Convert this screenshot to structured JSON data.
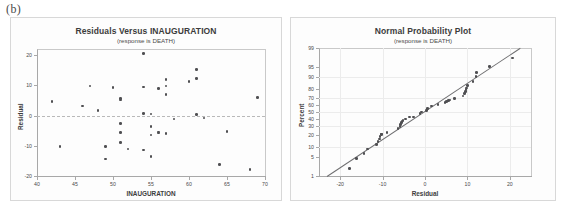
{
  "figure": {
    "label": "(b)",
    "marker_color": "#4f4f52",
    "line_color": "#6e6e70",
    "frame_color": "#a8a8a8"
  },
  "chart_data": [
    {
      "type": "scatter",
      "panel": "left",
      "title": "Residuals Versus INAUGURATION",
      "subtitle": "(response is DEATH)",
      "xlabel": "INAUGURATION",
      "ylabel": "Residual",
      "xlim": [
        40,
        70
      ],
      "ylim": [
        -20,
        22
      ],
      "xticks": [
        40,
        45,
        50,
        55,
        60,
        65,
        70
      ],
      "yticks": [
        20,
        10,
        0,
        -10,
        -20
      ],
      "grid": false,
      "reference_line": 0,
      "points": [
        {
          "x": 42,
          "y": 4.7
        },
        {
          "x": 43,
          "y": -10.2
        },
        {
          "x": 46,
          "y": 3.1
        },
        {
          "x": 47,
          "y": 9.7
        },
        {
          "x": 48,
          "y": 1.6
        },
        {
          "x": 49,
          "y": -10.2
        },
        {
          "x": 49,
          "y": -14.4
        },
        {
          "x": 50,
          "y": 9.3
        },
        {
          "x": 51,
          "y": 5.6
        },
        {
          "x": 51,
          "y": 5.1
        },
        {
          "x": 51,
          "y": -2.7
        },
        {
          "x": 51,
          "y": -5.6
        },
        {
          "x": 51,
          "y": -9.0
        },
        {
          "x": 52,
          "y": -11.1
        },
        {
          "x": 54,
          "y": 20.6
        },
        {
          "x": 54,
          "y": 9.5
        },
        {
          "x": 54,
          "y": 0.6
        },
        {
          "x": 54,
          "y": -11.4
        },
        {
          "x": 55,
          "y": 0.5
        },
        {
          "x": 55,
          "y": -3.7
        },
        {
          "x": 55,
          "y": -6.4
        },
        {
          "x": 55,
          "y": -13.5
        },
        {
          "x": 56,
          "y": 9.0
        },
        {
          "x": 56,
          "y": -5.4
        },
        {
          "x": 56,
          "y": -5.8
        },
        {
          "x": 57,
          "y": 12.0
        },
        {
          "x": 57,
          "y": 9.8
        },
        {
          "x": 57,
          "y": 6.9
        },
        {
          "x": 57,
          "y": -5.9
        },
        {
          "x": 58,
          "y": -1.2
        },
        {
          "x": 60,
          "y": 11.3
        },
        {
          "x": 61,
          "y": 15.2
        },
        {
          "x": 61,
          "y": 12.2
        },
        {
          "x": 61,
          "y": 0.3
        },
        {
          "x": 62,
          "y": -0.8
        },
        {
          "x": 64,
          "y": -16.2
        },
        {
          "x": 65,
          "y": -5.2
        },
        {
          "x": 68,
          "y": -17.8
        },
        {
          "x": 69,
          "y": 5.9
        }
      ]
    },
    {
      "type": "scatter",
      "panel": "right",
      "title": "Normal Probability Plot",
      "subtitle": "(response is DEATH)",
      "xlabel": "Residual",
      "ylabel": "Percent",
      "xlim": [
        -25,
        25
      ],
      "ylim_percent": [
        1,
        99
      ],
      "xticks": [
        -20,
        -10,
        0,
        10,
        20
      ],
      "yticks": [
        99,
        95,
        90,
        80,
        70,
        60,
        50,
        40,
        30,
        20,
        10,
        5,
        1
      ],
      "grid": true,
      "fit_line": {
        "x1": -23.0,
        "p1": 1.0,
        "x2": 22.5,
        "p2": 99.0
      },
      "points": [
        {
          "x": -17.8,
          "p": 2.0
        },
        {
          "x": -16.2,
          "p": 4.5
        },
        {
          "x": -14.4,
          "p": 6.5
        },
        {
          "x": -13.5,
          "p": 9.0
        },
        {
          "x": -11.4,
          "p": 12.0
        },
        {
          "x": -11.1,
          "p": 14.0
        },
        {
          "x": -10.8,
          "p": 16.5
        },
        {
          "x": -10.6,
          "p": 18.5
        },
        {
          "x": -10.2,
          "p": 20.5
        },
        {
          "x": -10.2,
          "p": 21.0
        },
        {
          "x": -9.0,
          "p": 22.5
        },
        {
          "x": -6.4,
          "p": 27.5
        },
        {
          "x": -5.9,
          "p": 30.0
        },
        {
          "x": -5.8,
          "p": 32.5
        },
        {
          "x": -5.6,
          "p": 35.0
        },
        {
          "x": -5.4,
          "p": 36.5
        },
        {
          "x": -5.2,
          "p": 38.0
        },
        {
          "x": -4.6,
          "p": 40.0
        },
        {
          "x": -3.7,
          "p": 42.5
        },
        {
          "x": -2.7,
          "p": 43.0
        },
        {
          "x": -1.2,
          "p": 47.5
        },
        {
          "x": -0.8,
          "p": 50.0
        },
        {
          "x": 0.3,
          "p": 52.5
        },
        {
          "x": 0.5,
          "p": 54.0
        },
        {
          "x": 0.6,
          "p": 55.0
        },
        {
          "x": 1.6,
          "p": 58.5
        },
        {
          "x": 3.1,
          "p": 60.5
        },
        {
          "x": 4.7,
          "p": 63.5
        },
        {
          "x": 5.1,
          "p": 65.0
        },
        {
          "x": 5.6,
          "p": 66.0
        },
        {
          "x": 5.9,
          "p": 67.0
        },
        {
          "x": 6.9,
          "p": 69.0
        },
        {
          "x": 9.0,
          "p": 72.0
        },
        {
          "x": 9.3,
          "p": 75.0
        },
        {
          "x": 9.5,
          "p": 77.5
        },
        {
          "x": 9.7,
          "p": 79.5
        },
        {
          "x": 9.8,
          "p": 81.0
        },
        {
          "x": 10.0,
          "p": 83.0
        },
        {
          "x": 11.3,
          "p": 86.5
        },
        {
          "x": 12.0,
          "p": 90.0
        },
        {
          "x": 12.2,
          "p": 92.5
        },
        {
          "x": 15.2,
          "p": 95.0
        },
        {
          "x": 20.6,
          "p": 97.5
        }
      ]
    }
  ]
}
